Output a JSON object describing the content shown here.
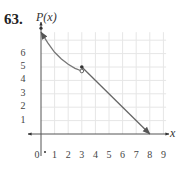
{
  "problem_number": "63.",
  "chart_data": {
    "type": "line",
    "title": "",
    "xlabel": "x",
    "ylabel": "P(x)",
    "x_ticks": [
      "0",
      "1",
      "2",
      "3",
      "4",
      "5",
      "6",
      "7",
      "8",
      "9"
    ],
    "y_ticks": [
      "1",
      "2",
      "3",
      "4",
      "5",
      "6"
    ],
    "xlim": [
      -0.5,
      9.5
    ],
    "ylim": [
      -0.5,
      8
    ],
    "grid": true,
    "series": [
      {
        "name": "piece-1-curve",
        "kind": "decreasing curve",
        "x": [
          0,
          0.5,
          1,
          1.5,
          2,
          2.5,
          3
        ],
        "y": [
          7.6,
          6.8,
          6.1,
          5.6,
          5.2,
          4.9,
          4.7
        ],
        "start": {
          "x": 0,
          "y": 7.6,
          "marker": "closed-dot-with-arrow"
        },
        "end": {
          "x": 3,
          "y": 4.7,
          "marker": "open-circle"
        }
      },
      {
        "name": "piece-2-line",
        "kind": "line",
        "x": [
          3,
          8
        ],
        "y": [
          5,
          0
        ],
        "start": {
          "x": 3,
          "y": 5,
          "marker": "closed-dot"
        },
        "end": {
          "x": 8,
          "y": 0,
          "marker": "arrow"
        }
      }
    ],
    "origin_marker": {
      "x": 0,
      "y": 0,
      "marker": "small-dot"
    }
  }
}
